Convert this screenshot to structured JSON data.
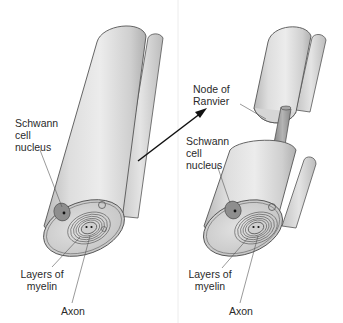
{
  "figure": {
    "panels": [
      {
        "id": "left",
        "labels": {
          "schwann_nucleus": "Schwann\ncell\nnucleus",
          "myelin_layers": "Layers of\nmyelin",
          "axon": "Axon"
        }
      },
      {
        "id": "right",
        "labels": {
          "node_of_ranvier": "Node of\nRanvier",
          "schwann_nucleus": "Schwann\ncell\nnucleus",
          "myelin_layers": "Layers of\nmyelin",
          "axon": "Axon"
        }
      }
    ],
    "arrow": {
      "direction": "left-to-right",
      "meaning": "progression"
    },
    "colors": {
      "tube_light": "#e6e6e6",
      "tube_mid": "#cfcfcf",
      "tube_dark": "#a9a9a9",
      "outline": "#555555",
      "axon": "#9a9a9a",
      "nucleus": "#8a8a8a",
      "text": "#2a2a2a",
      "divider": "#e2e2e2"
    }
  }
}
